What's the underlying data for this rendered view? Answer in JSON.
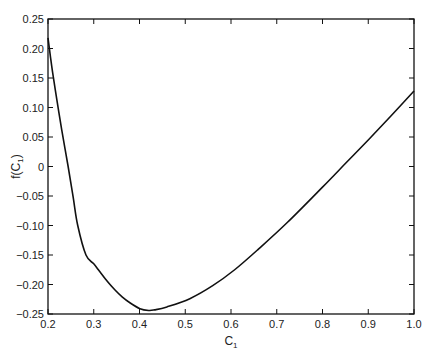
{
  "chart_data": {
    "type": "line",
    "title": "",
    "xlabel": "C",
    "xlabel_sub": "1",
    "ylabel": "f(C",
    "ylabel_sub": "1",
    "ylabel_close": ")",
    "xlim": [
      0.2,
      1.0
    ],
    "ylim": [
      -0.25,
      0.25
    ],
    "grid": false,
    "legend": null,
    "x_ticks": [
      0.2,
      0.3,
      0.4,
      0.5,
      0.6,
      0.7,
      0.8,
      0.9,
      1.0
    ],
    "x_tick_labels": [
      "0.2",
      "0.3",
      "0.4",
      "0.5",
      "0.6",
      "0.7",
      "0.8",
      "0.9",
      "1.0"
    ],
    "y_ticks": [
      0.25,
      0.2,
      0.15,
      0.1,
      0.05,
      0,
      -0.05,
      -0.1,
      -0.15,
      -0.2,
      -0.25
    ],
    "y_tick_labels": [
      "0.25",
      "0.20",
      "0.15",
      "0.10",
      "0.05",
      "0",
      "−0.05",
      "−0.10",
      "−0.15",
      "−0.20",
      "−0.25"
    ],
    "series": [
      {
        "name": "f(C1)",
        "color": "#111111",
        "x": [
          0.2,
          0.205,
          0.21,
          0.22,
          0.23,
          0.244,
          0.255,
          0.265,
          0.283,
          0.3,
          0.313,
          0.33,
          0.346,
          0.362,
          0.379,
          0.401,
          0.42,
          0.433,
          0.46,
          0.51,
          0.56,
          0.608,
          0.66,
          0.723,
          0.8,
          0.85,
          0.9,
          0.95,
          1.0
        ],
        "y": [
          0.218,
          0.188,
          0.16,
          0.11,
          0.062,
          0.0,
          -0.052,
          -0.1,
          -0.15,
          -0.165,
          -0.178,
          -0.195,
          -0.209,
          -0.221,
          -0.231,
          -0.241,
          -0.244,
          -0.243,
          -0.238,
          -0.224,
          -0.202,
          -0.175,
          -0.14,
          -0.095,
          -0.035,
          0.005,
          0.045,
          0.086,
          0.128
        ]
      }
    ]
  }
}
